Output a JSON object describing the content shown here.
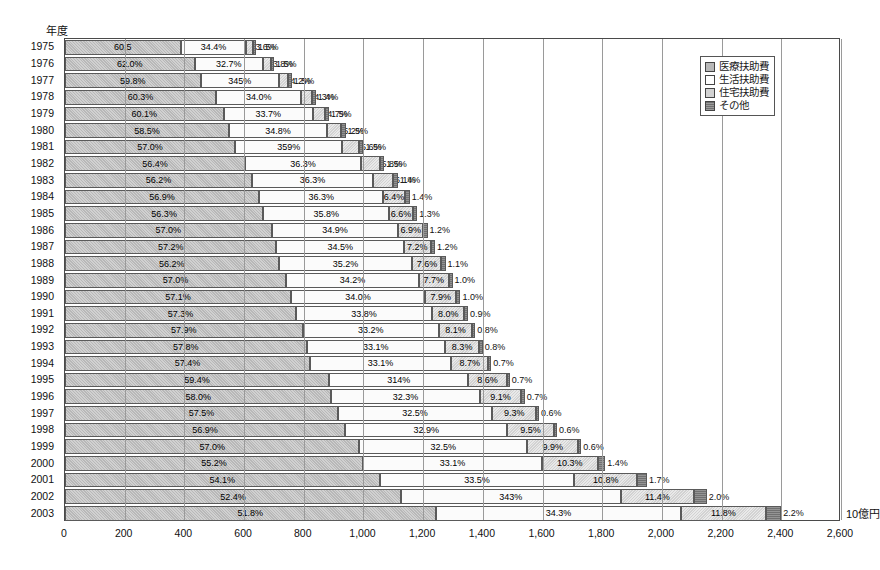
{
  "title": "",
  "axis_title_y": "年度",
  "unit_label": "10億円",
  "legend": {
    "items": [
      {
        "label": "医療扶助費",
        "color": "#b8b8b8"
      },
      {
        "label": "生活扶助費",
        "color": "#ffffff"
      },
      {
        "label": "住宅扶助費",
        "color": "#d2d2d2"
      },
      {
        "label": "その他",
        "color": "#707070"
      }
    ]
  },
  "chart_data": {
    "type": "bar",
    "orientation": "horizontal",
    "stacked": true,
    "title": "",
    "xlabel": "10億円",
    "ylabel": "年度",
    "xlim": [
      0,
      2600
    ],
    "xticks": [
      "0",
      "200",
      "400",
      "600",
      "800",
      "1,000",
      "1,200",
      "1,400",
      "1,600",
      "1,800",
      "2,000",
      "2,200",
      "2,400",
      "2,600"
    ],
    "grid": true,
    "legend_position": "top-right",
    "categories": [
      "1975",
      "1976",
      "1977",
      "1978",
      "1979",
      "1980",
      "1981",
      "1982",
      "1983",
      "1984",
      "1985",
      "1986",
      "1987",
      "1988",
      "1989",
      "1990",
      "1991",
      "1992",
      "1993",
      "1994",
      "1995",
      "1996",
      "1997",
      "1998",
      "1999",
      "2000",
      "2001",
      "2002",
      "2003"
    ],
    "series": [
      {
        "name": "医療扶助費",
        "values": [
          60.5,
          62.0,
          59.8,
          60.3,
          60.1,
          58.5,
          57.0,
          56.4,
          56.2,
          56.9,
          56.3,
          57.0,
          57.2,
          56.2,
          57.0,
          57.1,
          57.3,
          57.9,
          57.8,
          57.4,
          59.4,
          58.0,
          57.5,
          56.9,
          57.0,
          55.2,
          54.1,
          52.4,
          51.8
        ],
        "labels": [
          "60.5",
          "62.0%",
          "59.8%",
          "60.3%",
          "60.1%",
          "58.5%",
          "57.0%",
          "56.4%",
          "56.2%",
          "56.9%",
          "56.3%",
          "57.0%",
          "57.2%",
          "56.2%",
          "57.0%",
          "57.1%",
          "57.3%",
          "57.9%",
          "57.8%",
          "57.4%",
          "59.4%",
          "58.0%",
          "57.5%",
          "56.9%",
          "57.0%",
          "55.2%",
          "54.1%",
          "52.4%",
          "51.8%"
        ]
      },
      {
        "name": "生活扶助費",
        "values": [
          34.4,
          32.7,
          34.5,
          34.0,
          33.7,
          34.8,
          35.9,
          36.3,
          36.3,
          36.3,
          35.8,
          34.9,
          34.5,
          35.2,
          34.2,
          34.0,
          33.8,
          33.2,
          33.1,
          33.1,
          31.4,
          32.3,
          32.5,
          32.9,
          32.5,
          33.1,
          33.5,
          34.3,
          34.3
        ],
        "labels": [
          "34.4%",
          "32.7%",
          "345%",
          "34.0%",
          "33.7%",
          "34.8%",
          "359%",
          "36.3%",
          "36.3%",
          "36.3%",
          "35.8%",
          "34.9%",
          "34.5%",
          "35.2%",
          "34.2%",
          "34.0%",
          "33.8%",
          "33.2%",
          "33.1%",
          "33.1%",
          "314%",
          "32.3%",
          "32.5%",
          "32.9%",
          "32.5%",
          "33.1%",
          "33.5%",
          "343%",
          "34.3%"
        ]
      },
      {
        "name": "住宅扶助費",
        "values": [
          3.6,
          3.8,
          4.2,
          4.3,
          4.7,
          5.2,
          5.6,
          5.8,
          6.1,
          6.4,
          6.6,
          6.9,
          7.2,
          7.6,
          7.7,
          7.9,
          8.0,
          8.1,
          8.3,
          8.7,
          8.6,
          9.1,
          9.3,
          9.5,
          9.9,
          10.3,
          10.8,
          11.4,
          11.8
        ],
        "labels": [
          "3.6%",
          "3.8%",
          "4.2%",
          "4.3%",
          "4.7%",
          "5.2%",
          "5.6%",
          "5.8%",
          "6.1%",
          "6.4%",
          "6.6%",
          "6.9%",
          "7.2%",
          "7.6%",
          "7.7%",
          "7.9%",
          "8.0%",
          "8.1%",
          "8.3%",
          "8.7%",
          "8.6%",
          "9.1%",
          "9.3%",
          "9.5%",
          "9.9%",
          "10.3%",
          "10.8%",
          "11.4%",
          "11.8%"
        ]
      },
      {
        "name": "その他",
        "values": [
          1.5,
          1.5,
          1.5,
          1.4,
          1.5,
          1.5,
          1.5,
          1.5,
          1.4,
          1.4,
          1.3,
          1.2,
          1.2,
          1.1,
          1.0,
          1.0,
          0.9,
          0.8,
          0.8,
          0.7,
          0.7,
          0.7,
          0.6,
          0.6,
          0.6,
          1.4,
          1.7,
          2.0,
          2.2
        ],
        "labels": [
          "1.5%",
          "1.5%",
          "1.5%",
          "1.4%",
          "1.5%",
          "1.5%",
          "1.5%",
          "1.5%",
          "1.4%",
          "1.4%",
          "1.3%",
          "1.2%",
          "1.2%",
          "1.1%",
          "1.0%",
          "1.0%",
          "0.9%",
          "0.8%",
          "0.8%",
          "0.7%",
          "0.7%",
          "0.7%",
          "0.6%",
          "0.6%",
          "0.6%",
          "1.4%",
          "1.7%",
          "2.0%",
          "2.2%"
        ]
      }
    ],
    "totals": [
      640,
      700,
      760,
      840,
      885,
      940,
      1000,
      1070,
      1115,
      1155,
      1180,
      1215,
      1240,
      1275,
      1300,
      1325,
      1350,
      1375,
      1400,
      1430,
      1490,
      1540,
      1590,
      1650,
      1730,
      1810,
      1950,
      2150,
      2400
    ]
  }
}
